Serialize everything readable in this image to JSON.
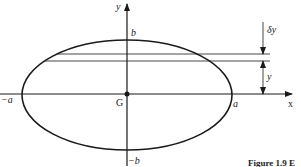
{
  "figure": {
    "caption": "Figure 1.9  E",
    "labels": {
      "y_axis": "y",
      "x_axis": "x",
      "b_top": "b",
      "b_bottom": "−b",
      "a_left": "−a",
      "a_right": "a",
      "centre": "G",
      "delta_y": "δy",
      "y_dim": "y"
    },
    "colors": {
      "stroke": "#1a1a1a",
      "background": "#ffffff"
    }
  }
}
